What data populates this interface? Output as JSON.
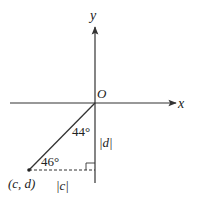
{
  "diagram": {
    "axes": {
      "x_label": "x",
      "y_label": "y",
      "origin_label": "O"
    },
    "point": {
      "label": "(c, d)"
    },
    "angles": {
      "upper_angle": "44°",
      "lower_angle": "46°"
    },
    "segments": {
      "vertical_length": "|d|",
      "horizontal_length": "|c|"
    },
    "colors": {
      "line": "#333333",
      "background": "#ffffff"
    }
  }
}
